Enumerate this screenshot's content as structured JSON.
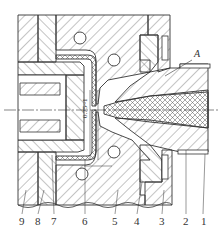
{
  "figure": {
    "type": "cross-section engineering drawing",
    "callout_A": "A",
    "dimension": "0.75~1",
    "part_labels": [
      {
        "num": "9",
        "x": 22
      },
      {
        "num": "8",
        "x": 38
      },
      {
        "num": "7",
        "x": 54
      },
      {
        "num": "6",
        "x": 85
      },
      {
        "num": "5",
        "x": 115
      },
      {
        "num": "4",
        "x": 137
      },
      {
        "num": "3",
        "x": 162
      },
      {
        "num": "2",
        "x": 186
      },
      {
        "num": "1",
        "x": 203
      }
    ]
  },
  "colors": {
    "line": "#333333",
    "hatch": "#555555",
    "background": "#ffffff"
  }
}
